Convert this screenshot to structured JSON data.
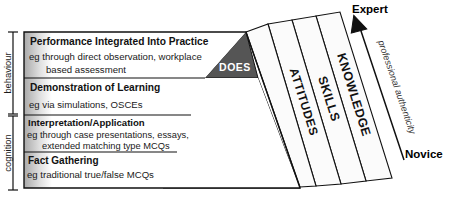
{
  "colors": {
    "does": "#555555",
    "shows": "#a8a8a8",
    "knows_how": "#7d7d7d",
    "knows": "#2b2b2b",
    "band_fill": "#fbfbfb",
    "outline": "#111111",
    "panel": "#ffffff"
  },
  "left_axis": {
    "upper_label": "behaviour",
    "lower_label": "cognition"
  },
  "rows": [
    {
      "id": "does",
      "heading": "Performance Integrated Into Practice",
      "examples": [
        "eg through direct observation, workplace",
        "based assessment"
      ],
      "pyramid_label": "DOES"
    },
    {
      "id": "shows",
      "heading": "Demonstration of Learning",
      "examples": [
        "eg via simulations, OSCEs"
      ],
      "pyramid_label": "SHOWS"
    },
    {
      "id": "knows-how",
      "heading": "Interpretation/Application",
      "examples": [
        "eg through case presentations, essays,",
        "extended matching type MCQs"
      ],
      "pyramid_label": "KNOWS HOW"
    },
    {
      "id": "knows",
      "heading": "Fact Gathering",
      "examples": [
        "eg traditional true/false MCQs"
      ],
      "pyramid_label": "KNOWS"
    }
  ],
  "bands": [
    {
      "id": "attitudes",
      "label": "ATTITUDES"
    },
    {
      "id": "skills",
      "label": "SKILLS"
    },
    {
      "id": "knowledge",
      "label": "KNOWLEDGE"
    }
  ],
  "arrow": {
    "label": "professional authenticity",
    "top_label": "Expert",
    "bottom_label": "Novice"
  }
}
